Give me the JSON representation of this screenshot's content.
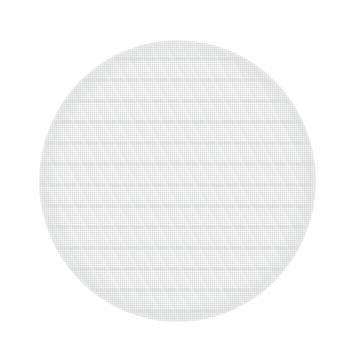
{
  "image": {
    "subject": "woven mesh fabric disc",
    "background_color": "#ffffff",
    "canvas": {
      "width": 343,
      "height": 356
    }
  },
  "disc": {
    "label": "circular woven mesh disc",
    "shape": "circle",
    "fill_color": "#eeeeee",
    "highlight_color": "#f1f1f1",
    "shadow_color": "#e7e7e7",
    "thread_color": "#d0d1d1",
    "bounds": {
      "left": 39,
      "top": 40,
      "width": 277,
      "height": 282
    },
    "center": {
      "x": 177,
      "y": 181
    },
    "texture": {
      "type": "plain weave",
      "warp_direction": "vertical",
      "weft_direction": "horizontal",
      "thread_period_px": 2,
      "has_drop_shadow": false
    }
  }
}
